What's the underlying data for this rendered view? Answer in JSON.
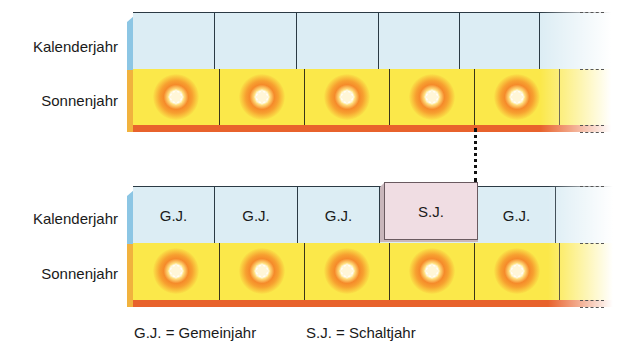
{
  "rows": {
    "kalenderjahr": "Kalenderjahr",
    "sonnenjahr": "Sonnenjahr"
  },
  "top_diagram": {
    "kalender_blocks": [
      "",
      "",
      "",
      "",
      "",
      ""
    ],
    "sonnen_blocks": [
      "sun",
      "sun",
      "sun",
      "sun",
      "sun",
      ""
    ]
  },
  "bottom_diagram": {
    "kalender_blocks": [
      "G.J.",
      "G.J.",
      "G.J.",
      "S.J.",
      "G.J.",
      ""
    ],
    "sonnen_blocks": [
      "sun",
      "sun",
      "sun",
      "sun",
      "sun",
      ""
    ]
  },
  "legend": {
    "gj": "G.J. = Gemeinjahr",
    "sj": "S.J. = Schaltjahr"
  },
  "colors": {
    "kalender": "#dcedf4",
    "sonnen": "#fbe84a",
    "strip": "#e8622c",
    "schaltjahr": "#f0dde3"
  }
}
